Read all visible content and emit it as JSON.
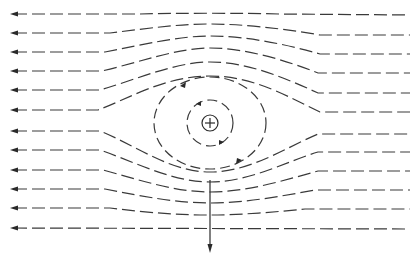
{
  "diagram": {
    "title": "",
    "colors": {
      "line": "#3a3a3a",
      "background": "#ffffff"
    },
    "flow_direction": "right-to-left",
    "vortex": {
      "center": [
        210,
        123
      ],
      "core_radius": 8,
      "core_symbol": "plus",
      "rotation": "clockwise",
      "closed_streamlines": [
        {
          "rx": 23,
          "ry": 23
        },
        {
          "rx": 56,
          "ry": 46
        }
      ]
    },
    "streamlines_top_y": [
      14,
      33,
      52,
      71,
      90,
      110
    ],
    "streamlines_bottom_y": [
      131,
      150,
      170,
      189,
      208,
      228
    ],
    "force_arrow": {
      "x": 210,
      "y_start": 180,
      "y_end": 252,
      "direction": "down"
    }
  }
}
